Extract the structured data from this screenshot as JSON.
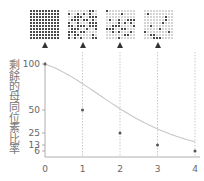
{
  "chart_data": {
    "type": "line",
    "title": "",
    "xlabel": "",
    "ylabel": "剩餘的母同位素比率",
    "x": [
      0,
      1,
      2,
      3,
      4
    ],
    "series": [
      {
        "name": "remaining parent isotope",
        "values": [
          100,
          50,
          25,
          13,
          6
        ]
      }
    ],
    "x_ticks": [
      "0",
      "1",
      "2",
      "3",
      "4"
    ],
    "y_ticks": [
      "100",
      "50",
      "25",
      "13",
      "6"
    ],
    "ylim": [
      0,
      100
    ],
    "xlim": [
      0,
      4
    ],
    "grid": "vertical dotted lines at x=1,2,3,4",
    "legend": "none",
    "panels": [
      {
        "x": 0,
        "filled_fraction": 1.0
      },
      {
        "x": 1,
        "filled_fraction": 0.5
      },
      {
        "x": 2,
        "filled_fraction": 0.25
      },
      {
        "x": 3,
        "filled_fraction": 0.125
      }
    ]
  },
  "colors": {
    "dot_filled": "#4a4a4a",
    "dot_empty": "#d4d4d4",
    "curve": "#c8c8c8",
    "axis": "#999999",
    "point": "#555555",
    "grid": "#bbbbbb"
  }
}
